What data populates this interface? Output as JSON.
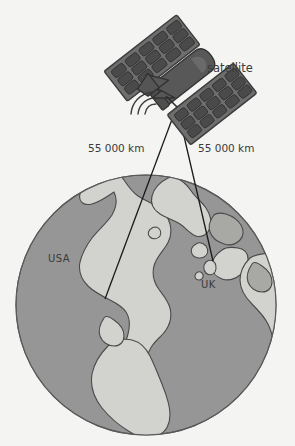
{
  "figure": {
    "background_color": "#f4f4f2"
  },
  "colors": {
    "background": "#f4f4f2",
    "ocean": "#969696",
    "land": "#d2d2ce",
    "land_shadow": "#a8a8a4",
    "outline": "#4a4a4a",
    "satellite_body": "#585858",
    "satellite_panel": "#6e6e6e",
    "satellite_cell": "#4a4a4a",
    "beam_line": "#1a1a1a",
    "text": "#3a3a3a"
  },
  "labels": {
    "satellite": "satellite",
    "distance_left": "55 000 km",
    "distance_right": "55 000 km",
    "region_left": "USA",
    "region_right": "UK"
  },
  "satellite": {
    "name": "satellite",
    "panel_count": 2,
    "panel_cell_columns": 5,
    "panel_cell_rows": 3,
    "has_antenna_dish": true,
    "signal_wave_arcs": 3
  },
  "globe": {
    "center_x": 146,
    "center_y": 305,
    "radius": 130,
    "landmasses": [
      "North America",
      "Greenland",
      "Europe",
      "Africa",
      "South America",
      "United Kingdom",
      "Iceland"
    ]
  },
  "beams": [
    {
      "name": "uplink-usa",
      "label": "55 000 km",
      "from": [
        177,
        106
      ],
      "to": [
        105,
        299
      ]
    },
    {
      "name": "uplink-uk",
      "label": "55 000 km",
      "from": [
        177,
        106
      ],
      "to": [
        213,
        261
      ]
    }
  ],
  "icons": {
    "satellite": "satellite-icon",
    "globe": "globe-icon",
    "signal": "signal-waves-icon"
  }
}
